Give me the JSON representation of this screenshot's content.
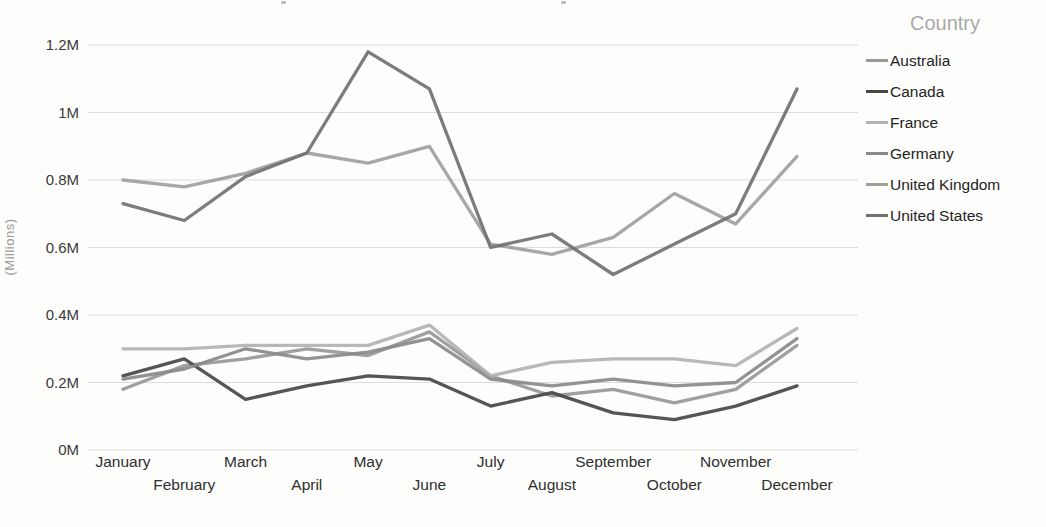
{
  "chart_data": {
    "type": "line",
    "title": "",
    "legend_title": "Country",
    "legend_position": "right",
    "ylabel": "(Millions)",
    "xlabel": "",
    "grid": true,
    "ylim": [
      0,
      1.2
    ],
    "categories": [
      "January",
      "February",
      "March",
      "April",
      "May",
      "June",
      "July",
      "August",
      "September",
      "October",
      "November",
      "December"
    ],
    "y_ticks": [
      {
        "label": "0M",
        "value": 0
      },
      {
        "label": "0.2M",
        "value": 0.2
      },
      {
        "label": "0.4M",
        "value": 0.4
      },
      {
        "label": "0.6M",
        "value": 0.6
      },
      {
        "label": "0.8M",
        "value": 0.8
      },
      {
        "label": "1M",
        "value": 1.0
      },
      {
        "label": "1.2M",
        "value": 1.2
      }
    ],
    "series": [
      {
        "name": "Australia",
        "color": "#989898",
        "values": [
          0.18,
          0.25,
          0.27,
          0.3,
          0.28,
          0.35,
          0.22,
          0.16,
          0.18,
          0.14,
          0.18,
          0.31
        ]
      },
      {
        "name": "Canada",
        "color": "#474747",
        "values": [
          0.22,
          0.27,
          0.15,
          0.19,
          0.22,
          0.21,
          0.13,
          0.17,
          0.11,
          0.09,
          0.13,
          0.19
        ]
      },
      {
        "name": "France",
        "color": "#b2b2b2",
        "values": [
          0.3,
          0.3,
          0.31,
          0.31,
          0.31,
          0.37,
          0.22,
          0.26,
          0.27,
          0.27,
          0.25,
          0.36
        ]
      },
      {
        "name": "Germany",
        "color": "#8a8a8a",
        "values": [
          0.21,
          0.24,
          0.3,
          0.27,
          0.29,
          0.33,
          0.21,
          0.19,
          0.21,
          0.19,
          0.2,
          0.33
        ]
      },
      {
        "name": "United Kingdom",
        "color": "#a0a0a0",
        "values": [
          0.8,
          0.78,
          0.82,
          0.88,
          0.85,
          0.9,
          0.61,
          0.58,
          0.63,
          0.76,
          0.67,
          0.87
        ]
      },
      {
        "name": "United States",
        "color": "#717171",
        "values": [
          0.73,
          0.68,
          0.81,
          0.88,
          1.18,
          1.07,
          0.6,
          0.64,
          0.52,
          0.61,
          0.7,
          1.07
        ]
      }
    ]
  }
}
